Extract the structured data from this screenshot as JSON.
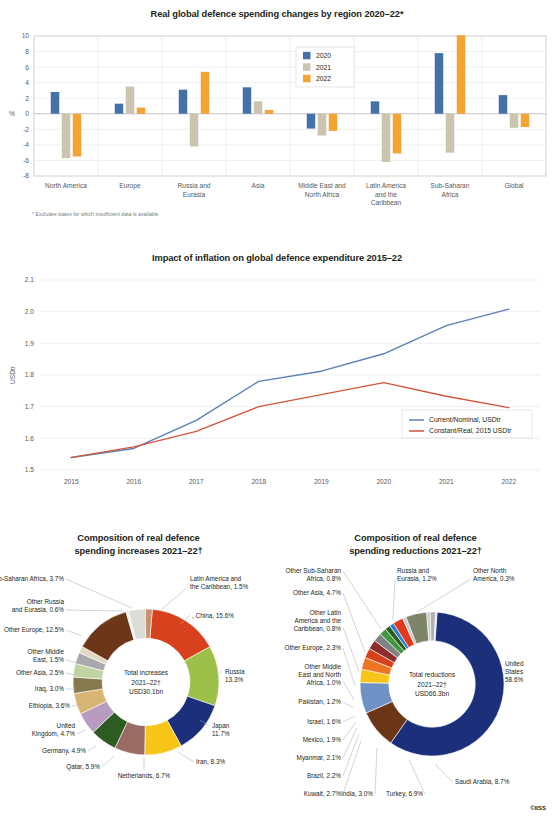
{
  "credit": "©IISS",
  "panels": {
    "bar": {
      "title": "Real global defence spending changes by region 2020–22*",
      "footnote": "* Excludes states for which insufficient data is available",
      "ylabel": "%"
    },
    "line": {
      "title": "Impact of inflation on global defence expenditure 2015–22",
      "ylabel": "USDtr"
    },
    "donut_increases": {
      "title_line1": "Composition of real defence",
      "title_line2": "spending increases 2021–22†",
      "center_line1": "Total increases",
      "center_line2": "2021–22†",
      "center_line3": "USD30.1bn"
    },
    "donut_reductions": {
      "title_line1": "Composition of real defence",
      "title_line2": "spending reductions 2021–22†",
      "center_line1": "Total reductions",
      "center_line2": "2021–22†",
      "center_line3": "USD66.3bn"
    }
  },
  "chart_data": [
    {
      "type": "bar",
      "title": "Real global defence spending changes by region 2020–22*",
      "xlabel": "",
      "ylabel": "%",
      "ylim": [
        -8,
        10
      ],
      "yticks": [
        -8,
        -6,
        -4,
        -2,
        0,
        2,
        4,
        6,
        8,
        10
      ],
      "grid": true,
      "legend_position": "top-center",
      "categories": [
        "North America",
        "Europe",
        "Russia and Eurasia",
        "Asia",
        "Middle East and North Africa",
        "Latin America and the Caribbean",
        "Sub-Saharan Africa",
        "Global"
      ],
      "series": [
        {
          "name": "2020",
          "color": "#4472a8",
          "values": [
            2.8,
            1.3,
            3.1,
            3.4,
            -1.9,
            1.6,
            7.8,
            2.4
          ]
        },
        {
          "name": "2021",
          "color": "#cdc4b0",
          "values": [
            -5.7,
            3.5,
            -4.2,
            1.6,
            -2.8,
            -6.2,
            -5.0,
            -1.8
          ]
        },
        {
          "name": "2022",
          "color": "#f5a333",
          "values": [
            -5.5,
            0.8,
            5.4,
            0.5,
            -2.2,
            -5.1,
            10.1,
            -1.7
          ]
        }
      ],
      "annotations": [
        "* Excludes states for which insufficient data is available"
      ]
    },
    {
      "type": "line",
      "title": "Impact of inflation on global defence expenditure 2015–22",
      "xlabel": "",
      "ylabel": "USDtr",
      "ylim": [
        1.5,
        2.1
      ],
      "yticks": [
        1.5,
        1.6,
        1.7,
        1.8,
        1.9,
        2.0,
        2.1
      ],
      "x": [
        "2015",
        "2016",
        "2017",
        "2018",
        "2019",
        "2020",
        "2021",
        "2022"
      ],
      "grid": true,
      "legend_position": "bottom-right",
      "series": [
        {
          "name": "Current/Nominal, USDtr",
          "color": "#5b7fb8",
          "values": [
            1.539,
            1.568,
            1.657,
            1.78,
            1.812,
            1.867,
            1.956,
            2.008
          ]
        },
        {
          "name": "Constant/Real, 2015 USDtr",
          "color": "#d3553a",
          "values": [
            1.54,
            1.573,
            1.622,
            1.7,
            1.738,
            1.776,
            1.733,
            1.697
          ]
        }
      ]
    },
    {
      "type": "pie",
      "variant": "donut",
      "title": "Composition of real defence spending increases 2021–22†",
      "center_label": "Total increases 2021–22† USD30.1bn",
      "total": "USD30.1bn",
      "labels": [
        "China, 15.6%",
        "Russia 13.3%",
        "Japan 11.7%",
        "Iran, 8.3%",
        "Netherlands, 6.7%",
        "Qatar, 5.9%",
        "Germany, 4.9%",
        "United Kingdom, 4.7%",
        "Ethiopia, 3.6%",
        "Iraq, 3.0%",
        "Other Asia, 2.5%",
        "Other Middle East, 1.5%",
        "Other Europe, 12.5%",
        "Other Russia and Eurasia, 0.6%",
        "Other Sub-Saharan Africa, 3.7%",
        "Latin America and the Caribbean, 1.5%"
      ],
      "slices": [
        {
          "name": "China",
          "value": 15.6,
          "color": "#d8411e"
        },
        {
          "name": "Russia",
          "value": 13.3,
          "color": "#9dc04a"
        },
        {
          "name": "Japan",
          "value": 11.7,
          "color": "#1b2f7a"
        },
        {
          "name": "Iran",
          "value": 8.3,
          "color": "#f6c518"
        },
        {
          "name": "Netherlands",
          "value": 6.7,
          "color": "#9a6b64"
        },
        {
          "name": "Qatar",
          "value": 5.9,
          "color": "#2c5c22"
        },
        {
          "name": "Germany",
          "value": 4.9,
          "color": "#b79bc0"
        },
        {
          "name": "United Kingdom",
          "value": 4.7,
          "color": "#d9b573"
        },
        {
          "name": "Ethiopia",
          "value": 3.6,
          "color": "#857a4e"
        },
        {
          "name": "Iraq",
          "value": 3.0,
          "color": "#c2d3a3"
        },
        {
          "name": "Other Asia",
          "value": 2.5,
          "color": "#a7a9ac"
        },
        {
          "name": "Other Middle East",
          "value": 1.5,
          "color": "#e0d9c4"
        },
        {
          "name": "Other Europe",
          "value": 12.5,
          "color": "#6b3718"
        },
        {
          "name": "Other Russia and Eurasia",
          "value": 0.6,
          "color": "#efefef"
        },
        {
          "name": "Other Sub-Saharan Africa",
          "value": 3.7,
          "color": "#dcdcd6"
        },
        {
          "name": "Latin America and the Caribbean",
          "value": 1.5,
          "color": "#c6916c"
        }
      ]
    },
    {
      "type": "pie",
      "variant": "donut",
      "title": "Composition of real defence spending reductions 2021–22†",
      "center_label": "Total reductions 2021–22† USD66.3bn",
      "total": "USD66.3bn",
      "labels": [
        "United States 58.6%",
        "Saudi Arabia, 8.7%",
        "Turkey, 6.9%",
        "India, 3.0%",
        "Kuwait, 2.7%",
        "Brazil, 2.2%",
        "Myanmar, 2.1%",
        "Mexico, 1.9%",
        "Israel, 1.6%",
        "Pakistan, 1.2%",
        "Other Middle East and North Africa, 1.0%",
        "Other Europe, 2.3%",
        "Other Latin America and the Caribbean, 0.8%",
        "Other Asia, 4.7%",
        "Other Sub-Saharan Africa, 0.8%",
        "Russia and Eurasia, 1.2%",
        "Other North America, 0.3%"
      ],
      "slices": [
        {
          "name": "United States",
          "value": 58.6,
          "color": "#1b2f7a"
        },
        {
          "name": "Saudi Arabia",
          "value": 8.7,
          "color": "#6b3718"
        },
        {
          "name": "Turkey",
          "value": 6.9,
          "color": "#6f92c4"
        },
        {
          "name": "India",
          "value": 3.0,
          "color": "#f6c518"
        },
        {
          "name": "Kuwait",
          "value": 2.7,
          "color": "#ee7523"
        },
        {
          "name": "Brazil",
          "value": 2.2,
          "color": "#d8411e"
        },
        {
          "name": "Myanmar",
          "value": 2.1,
          "color": "#8e2b2b"
        },
        {
          "name": "Mexico",
          "value": 1.9,
          "color": "#808285"
        },
        {
          "name": "Israel",
          "value": 1.6,
          "color": "#3f9a3f"
        },
        {
          "name": "Pakistan",
          "value": 1.2,
          "color": "#2c5c22"
        },
        {
          "name": "Other Middle East and North Africa",
          "value": 1.0,
          "color": "#2f7fd0"
        },
        {
          "name": "Other Europe",
          "value": 2.3,
          "color": "#e03a1a"
        },
        {
          "name": "Other Latin America and the Caribbean",
          "value": 0.8,
          "color": "#c9cbcd"
        },
        {
          "name": "Other Asia",
          "value": 4.7,
          "color": "#7d8467"
        },
        {
          "name": "Other Sub-Saharan Africa",
          "value": 0.8,
          "color": "#c9cbcd"
        },
        {
          "name": "Russia and Eurasia",
          "value": 1.2,
          "color": "#aab0b6"
        },
        {
          "name": "Other North America",
          "value": 0.3,
          "color": "#dfe1e3"
        }
      ]
    }
  ]
}
